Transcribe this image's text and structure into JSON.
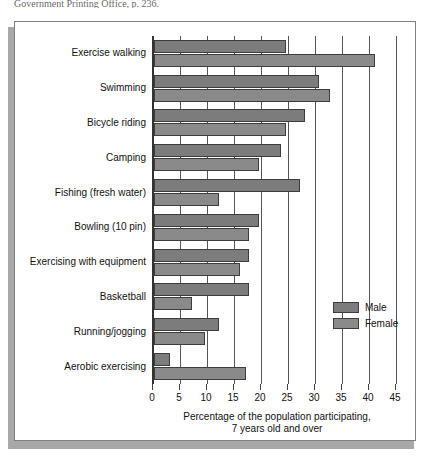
{
  "citation": "Government Printing Office, p. 236.",
  "chart_data": {
    "type": "bar",
    "orientation": "horizontal",
    "title": "",
    "xlabel_line1": "Percentage of the population participating,",
    "xlabel_line2": "7 years old and over",
    "ylabel": "",
    "xlim": [
      0,
      45
    ],
    "xticks": [
      0,
      5,
      10,
      15,
      20,
      25,
      30,
      35,
      40,
      45
    ],
    "xtick_labels": [
      "0",
      "5",
      "10",
      "15",
      "20",
      "25",
      "30",
      "35",
      "40",
      "45"
    ],
    "grid": true,
    "legend_position": "right-middle",
    "categories": [
      "Exercise walking",
      "Swimming",
      "Bicycle riding",
      "Camping",
      "Fishing (fresh water)",
      "Bowling (10 pin)",
      "Exercising with equipment",
      "Basketball",
      "Running/jogging",
      "Aerobic exercising"
    ],
    "series": [
      {
        "name": "Male",
        "color": "#7c7c7c",
        "values": [
          24.5,
          30.5,
          28.0,
          23.5,
          27.0,
          19.5,
          17.5,
          17.5,
          12.0,
          3.0
        ]
      },
      {
        "name": "Female",
        "color": "#8a8a8a",
        "values": [
          41.0,
          32.5,
          24.5,
          19.5,
          12.0,
          17.5,
          16.0,
          7.0,
          9.5,
          17.0
        ]
      }
    ]
  },
  "legend": {
    "items": [
      {
        "label": "Male",
        "key": "male"
      },
      {
        "label": "Female",
        "key": "female"
      }
    ]
  }
}
